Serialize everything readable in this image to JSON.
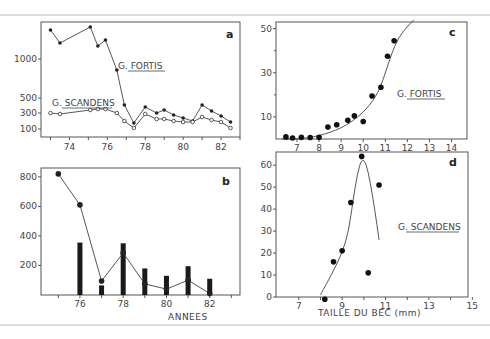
{
  "figure": {
    "top_rule_y": 15,
    "bottom_rule_y": 325
  },
  "chart_data": [
    {
      "id": "a",
      "type": "line",
      "panel_letter": "a",
      "title": "",
      "xlabel": "",
      "ylabel": "",
      "box": {
        "x0": 41,
        "y0": 22,
        "x1": 240,
        "y1": 137
      },
      "xlim": [
        72.5,
        83.0
      ],
      "x_ticks": [
        74,
        76,
        78,
        80,
        82
      ],
      "x_minor_ticks": [
        73,
        75,
        77,
        79,
        81,
        83
      ],
      "y_tick_positions": [
        {
          "label": "1000",
          "py": 59
        },
        {
          "label": "500",
          "py": 98
        },
        {
          "label": "300",
          "py": 113
        },
        {
          "label": "100",
          "py": 129
        }
      ],
      "y_scale_note": "non-linear (compressed) scale; values read off tick labels",
      "series": [
        {
          "name": "G. FORTIS",
          "marker": "filled-circle",
          "label_pos": {
            "x": 118,
            "y": 66
          },
          "x": [
            73.0,
            73.5,
            75.1,
            75.5,
            75.9,
            76.5,
            76.9,
            77.4,
            78.0,
            78.6,
            79.0,
            79.5,
            80.0,
            80.5,
            81.0,
            81.5,
            82.0,
            82.5
          ],
          "py": [
            30,
            43,
            27,
            46,
            40,
            70,
            105,
            123,
            107,
            113,
            110,
            115,
            118,
            121,
            105,
            111,
            116,
            122
          ],
          "values": [
            1400,
            1200,
            1450,
            1150,
            1200,
            820,
            420,
            160,
            380,
            300,
            330,
            280,
            260,
            230,
            400,
            330,
            280,
            180
          ]
        },
        {
          "name": "G. SCANDENS",
          "marker": "open-circle",
          "label_pos": {
            "x": 52,
            "y": 103
          },
          "x": [
            73.0,
            73.5,
            75.1,
            75.5,
            75.9,
            76.5,
            76.9,
            77.4,
            78.0,
            78.6,
            79.0,
            79.5,
            80.0,
            80.5,
            81.0,
            81.5,
            82.0,
            82.5
          ],
          "py": [
            113,
            114,
            110,
            109,
            109,
            113,
            121,
            128,
            114,
            119,
            119,
            121,
            122,
            122,
            117,
            120,
            122,
            128
          ],
          "values": [
            310,
            290,
            350,
            370,
            370,
            310,
            200,
            110,
            290,
            220,
            220,
            200,
            190,
            180,
            250,
            210,
            190,
            110
          ]
        }
      ]
    },
    {
      "id": "b",
      "type": "bar+line",
      "panel_letter": "b",
      "xlabel": "ANNEES",
      "ylabel": "",
      "box": {
        "x0": 41,
        "y0": 168,
        "x1": 240,
        "y1": 295
      },
      "xlim": [
        74.2,
        83.4
      ],
      "ylim": [
        0,
        860
      ],
      "x_ticks": [
        76,
        78,
        80,
        82
      ],
      "x_minor_ticks": [
        75,
        77,
        79,
        81,
        83
      ],
      "y_ticks": [
        200,
        400,
        600,
        800
      ],
      "categories": [
        75,
        76,
        77,
        78,
        79,
        80,
        81,
        82
      ],
      "series": [
        {
          "name": "line (filled circles)",
          "type": "line",
          "x": [
            75,
            76,
            77,
            78,
            79,
            80,
            81,
            82
          ],
          "values": [
            820,
            610,
            95,
            285,
            75,
            40,
            100,
            10
          ]
        },
        {
          "name": "bars",
          "type": "bar",
          "x": [
            76,
            77,
            78,
            79,
            80,
            81,
            82
          ],
          "values": [
            355,
            65,
            350,
            180,
            130,
            195,
            110
          ]
        }
      ]
    },
    {
      "id": "c",
      "type": "scatter",
      "panel_letter": "c",
      "title": "",
      "xlabel": "",
      "ylabel": "",
      "species_label": "G. FORTIS",
      "box": {
        "x0": 276,
        "y0": 22,
        "x1": 467,
        "y1": 139
      },
      "xlim": [
        6.05,
        14.7
      ],
      "ylim": [
        0,
        53
      ],
      "x_ticks": [
        7,
        8,
        9,
        10,
        11,
        12,
        13,
        14
      ],
      "y_ticks": [
        10,
        30,
        50
      ],
      "y_minor_ticks": [
        20,
        40
      ],
      "points": {
        "x": [
          6.5,
          6.8,
          7.2,
          7.6,
          8.0,
          8.4,
          8.8,
          9.3,
          9.6,
          10.0,
          10.4,
          10.8,
          11.1,
          11.4
        ],
        "y": [
          0.5,
          0,
          0.3,
          0.2,
          0.3,
          5,
          6,
          8,
          10,
          7.5,
          19,
          23,
          37,
          44
        ]
      },
      "fit_curve": {
        "x": [
          6.3,
          7.0,
          7.5,
          8.0,
          8.5,
          9.0,
          9.5,
          10.0,
          10.5,
          10.8,
          11.0,
          11.3,
          11.6,
          12.0,
          12.3
        ],
        "y": [
          0,
          0,
          0.5,
          1.5,
          3,
          5,
          8,
          12,
          18,
          24,
          30,
          39,
          46,
          51,
          54
        ]
      }
    },
    {
      "id": "d",
      "type": "scatter",
      "panel_letter": "d",
      "title": "",
      "xlabel": "TAILLE DU BEC (mm)",
      "ylabel": "",
      "species_label": "G. SCANDENS",
      "box": {
        "x0": 276,
        "y0": 152,
        "x1": 468,
        "y1": 297
      },
      "xlim": [
        5.95,
        14.8
      ],
      "ylim": [
        0,
        66
      ],
      "x_ticks": [
        7,
        9,
        11,
        13,
        15
      ],
      "x_minor_ticks": [
        8,
        10,
        12,
        14
      ],
      "y_ticks": [
        0,
        10,
        20,
        30,
        40,
        50,
        60
      ],
      "points": {
        "x": [
          8.2,
          8.6,
          9.0,
          9.4,
          9.9,
          10.2,
          10.7
        ],
        "y": [
          -1,
          16,
          21,
          43,
          64,
          11,
          51
        ]
      },
      "fit_curve": {
        "x": [
          8.0,
          8.5,
          9.0,
          9.3,
          9.5,
          9.7,
          9.9,
          10.1,
          10.3,
          10.5,
          10.7
        ],
        "y": [
          1,
          10,
          20,
          30,
          44,
          56,
          63,
          61,
          52,
          40,
          26
        ]
      }
    }
  ]
}
